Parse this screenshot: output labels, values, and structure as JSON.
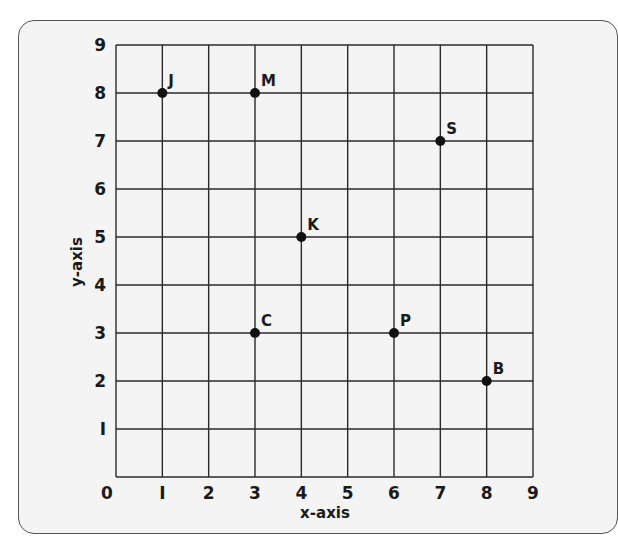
{
  "chart_data": {
    "type": "scatter",
    "title": "",
    "xlabel": "x-axis",
    "ylabel": "y-axis",
    "xlim": [
      0,
      9
    ],
    "ylim": [
      0,
      9
    ],
    "grid": true,
    "x_ticks": [
      "0",
      "I",
      "2",
      "3",
      "4",
      "5",
      "6",
      "7",
      "8",
      "9"
    ],
    "y_ticks": [
      "0",
      "I",
      "2",
      "3",
      "4",
      "5",
      "6",
      "7",
      "8",
      "9"
    ],
    "points": [
      {
        "label": "J",
        "x": 1,
        "y": 8
      },
      {
        "label": "M",
        "x": 3,
        "y": 8
      },
      {
        "label": "S",
        "x": 7,
        "y": 7
      },
      {
        "label": "K",
        "x": 4,
        "y": 5
      },
      {
        "label": "C",
        "x": 3,
        "y": 3
      },
      {
        "label": "P",
        "x": 6,
        "y": 3
      },
      {
        "label": "B",
        "x": 8,
        "y": 2
      }
    ],
    "colors": {
      "grid": "#2a2a2a",
      "point": "#111111",
      "panel": "#f4f4f4"
    }
  }
}
